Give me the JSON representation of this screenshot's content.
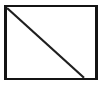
{
  "figure": {
    "name": "rectangle-with-diagonal",
    "description": "Black rectangular outline containing a single diagonal line from the top-left corner to the bottom edge",
    "canvas": {
      "width": 103,
      "height": 86,
      "background_color": "#ffffff"
    },
    "shapes": {
      "rectangle": {
        "label": "rectangle-outline",
        "x": 5.2,
        "y": 6.2,
        "width": 91.0,
        "height": 72.6,
        "stroke_color": "#141414",
        "stroke_width": 2.6,
        "fill_color": "#ffffff"
      },
      "diagonal": {
        "label": "diagonal-line",
        "x1": 7.0,
        "y1": 8.0,
        "x2": 84.0,
        "y2": 77.8,
        "stroke_color": "#1f1f1f",
        "stroke_width": 2.2
      }
    }
  }
}
